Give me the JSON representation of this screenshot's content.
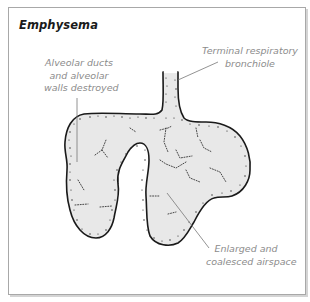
{
  "figure": {
    "title": "Emphysema",
    "labels": {
      "alveolar_ducts": [
        "Alveolar ducts",
        "and alveolar",
        "walls destroyed"
      ],
      "terminal_bronchiole": [
        "Terminal respiratory",
        "bronchiole"
      ],
      "enlarged_airspace": [
        "Enlarged and",
        "coalesced airspace"
      ]
    }
  },
  "colors": {
    "frame_border": "#a8a8a8",
    "tissue_fill": "#e8e8e8",
    "outline": "#1a1a1a",
    "label_text": "#8c8c8c",
    "leader_line": "#777777"
  }
}
